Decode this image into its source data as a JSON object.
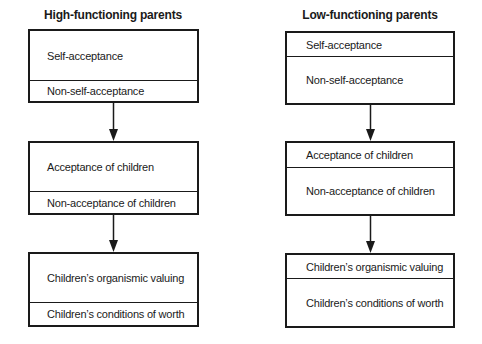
{
  "columns": [
    {
      "title": "High-functioning parents",
      "boxes": [
        {
          "top": "Self-acceptance",
          "bottom": "Non-self-acceptance",
          "emphasis": "top"
        },
        {
          "top": "Acceptance of children",
          "bottom": "Non-acceptance of children",
          "emphasis": "top"
        },
        {
          "top": "Children’s organismic valuing",
          "bottom": "Children’s conditions of worth",
          "emphasis": "top"
        }
      ]
    },
    {
      "title": "Low-functioning parents",
      "boxes": [
        {
          "top": "Self-acceptance",
          "bottom": "Non-self-acceptance",
          "emphasis": "bottom"
        },
        {
          "top": "Acceptance of children",
          "bottom": "Non-acceptance of children",
          "emphasis": "bottom"
        },
        {
          "top": "Children’s organismic valuing",
          "bottom": "Children’s conditions of worth",
          "emphasis": "bottom"
        }
      ]
    }
  ],
  "arrows": [
    {
      "column": "left",
      "from": "box-1",
      "to": "box-2",
      "icon": "arrow-down"
    },
    {
      "column": "left",
      "from": "box-2",
      "to": "box-3",
      "icon": "arrow-down"
    },
    {
      "column": "right",
      "from": "box-1",
      "to": "box-2",
      "icon": "arrow-down"
    },
    {
      "column": "right",
      "from": "box-2",
      "to": "box-3",
      "icon": "arrow-down"
    }
  ]
}
